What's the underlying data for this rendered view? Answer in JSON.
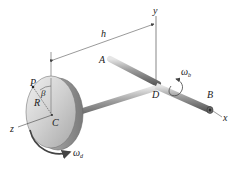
{
  "diagram": {
    "type": "rigid-body-kinematics",
    "labels": {
      "y_axis": "y",
      "x_axis": "x",
      "z_axis": "z",
      "dimension_h": "h",
      "point_A": "A",
      "point_B": "B",
      "point_D": "D",
      "point_C": "C",
      "point_P": "P",
      "radius_R": "R",
      "angle_beta": "β",
      "omega_b_symbol": "ω",
      "omega_b_sub": "b",
      "omega_d_symbol": "ω",
      "omega_d_sub": "d"
    },
    "colors": {
      "line": "#555555",
      "text": "#1a1a1a",
      "disk_face": "#c9c9c9",
      "disk_rim": "#9a9a9a",
      "shaft": "#8a8a8a",
      "arrow": "#444444"
    }
  }
}
